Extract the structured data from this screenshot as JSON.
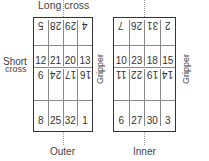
{
  "labels": {
    "long_cross": "Long cross",
    "short_cross_line1": "Short",
    "short_cross_line2": "cross",
    "gripper_left": "Gripper",
    "gripper_right": "Gripper",
    "outer": "Outer",
    "inner": "Inner"
  },
  "outer_grid": {
    "rows": [
      {
        "orientation": "upside-down",
        "cells": [
          "5",
          "28",
          "29",
          "4"
        ]
      },
      {
        "orientation": "upright",
        "cells": [
          "12",
          "21",
          "20",
          "13"
        ]
      },
      {
        "orientation": "upside-down",
        "cells": [
          "9",
          "24",
          "17",
          "16"
        ]
      },
      {
        "orientation": "upright",
        "cells": [
          "8",
          "25",
          "32",
          "1"
        ]
      }
    ]
  },
  "inner_grid": {
    "rows": [
      {
        "orientation": "upside-down",
        "cells": [
          "7",
          "26",
          "31",
          "2"
        ]
      },
      {
        "orientation": "upright",
        "cells": [
          "10",
          "23",
          "18",
          "15"
        ]
      },
      {
        "orientation": "upside-down",
        "cells": [
          "11",
          "22",
          "19",
          "14"
        ]
      },
      {
        "orientation": "upright",
        "cells": [
          "6",
          "27",
          "30",
          "3"
        ]
      }
    ]
  }
}
